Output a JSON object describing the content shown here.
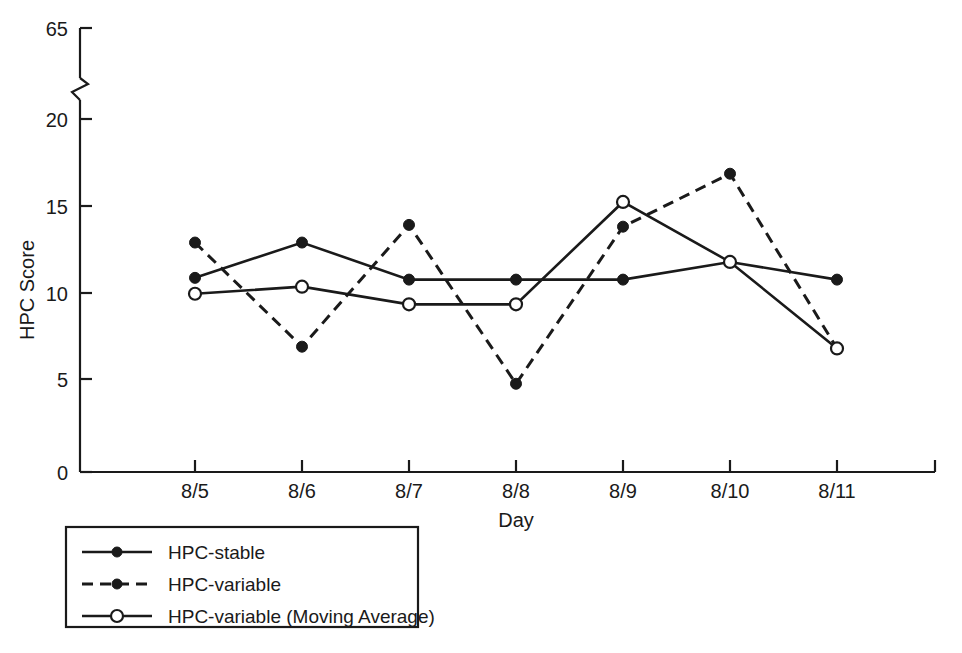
{
  "chart_data": {
    "type": "line",
    "title": "",
    "xlabel": "Day",
    "ylabel": "HPC Score",
    "categories": [
      "8/5",
      "8/6",
      "8/7",
      "8/8",
      "8/9",
      "8/10",
      "8/11"
    ],
    "x": [
      0,
      1,
      2,
      3,
      4,
      5,
      6
    ],
    "ylim": [
      0,
      65
    ],
    "y_axis_break": {
      "present": true,
      "break_low": 20,
      "break_high": 65,
      "note": "axis broken between 20 and 65"
    },
    "yticks": [
      0,
      5,
      10,
      15,
      20,
      65
    ],
    "ytick_labels": [
      "0",
      "5",
      "10",
      "15",
      "20",
      "65"
    ],
    "grid": false,
    "legend_position": "below-left",
    "series": [
      {
        "name": "HPC-stable",
        "line_style": "solid",
        "marker": "filled-circle",
        "color": "#1a1a1a",
        "values": [
          11.0,
          13.0,
          10.9,
          10.9,
          10.9,
          11.9,
          10.9
        ]
      },
      {
        "name": "HPC-variable",
        "line_style": "dashed",
        "marker": "filled-circle",
        "color": "#1a1a1a",
        "values": [
          13.0,
          7.1,
          14.0,
          5.0,
          13.9,
          16.9,
          7.0
        ]
      },
      {
        "name": "HPC-variable (Moving Average)",
        "line_style": "solid",
        "marker": "open-circle",
        "color": "#1a1a1a",
        "values": [
          10.1,
          10.5,
          9.5,
          9.5,
          15.3,
          11.9,
          7.0
        ]
      }
    ]
  },
  "legend": {
    "entries": [
      {
        "label": "HPC-stable",
        "style": "solid-filled"
      },
      {
        "label": "HPC-variable",
        "style": "dashed-filled"
      },
      {
        "label": "HPC-variable (Moving Average)",
        "style": "solid-open"
      }
    ]
  },
  "colors": {
    "ink": "#1a1a1a",
    "background": "#ffffff"
  }
}
